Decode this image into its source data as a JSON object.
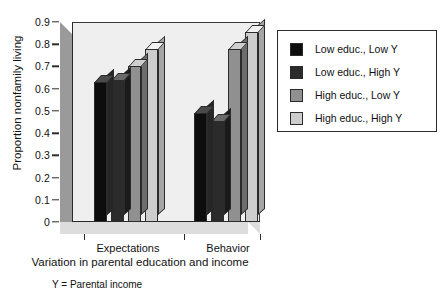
{
  "chart_data": {
    "type": "bar",
    "title": "",
    "subtitle": "",
    "xlabel": "Variation in parental education and income",
    "ylabel": "Proportion nonfamily living",
    "categories": [
      "Expectations",
      "Behavior"
    ],
    "ylim": [
      0,
      0.9
    ],
    "ytick_labels": [
      "0",
      "0.1",
      "0.2",
      "0.3",
      "0.4",
      "0.5",
      "0.6",
      "0.7",
      "0.8",
      "0.9"
    ],
    "ytick_values": [
      0,
      0.1,
      0.2,
      0.3,
      0.4,
      0.5,
      0.6,
      0.7,
      0.8,
      0.9
    ],
    "grid": false,
    "legend_position": "right",
    "footnote": "Y = Parental income",
    "series": [
      {
        "name": "Low educ., Low Y",
        "color": "#0d0d0d",
        "top_color": "#4a4a4a",
        "side_color": "#262626",
        "values": [
          0.63,
          0.49
        ]
      },
      {
        "name": "Low educ., High Y",
        "color": "#2b2b2b",
        "top_color": "#6a6a6a",
        "side_color": "#1a1a1a",
        "values": [
          0.64,
          0.455
        ]
      },
      {
        "name": "High educ., Low Y",
        "color": "#909090",
        "top_color": "#cfcfcf",
        "side_color": "#6d6d6d",
        "values": [
          0.7,
          0.78
        ]
      },
      {
        "name": "High educ., High Y",
        "color": "#cdcdcd",
        "top_color": "#f2f2f2",
        "side_color": "#a6a6a6",
        "values": [
          0.78,
          0.855
        ]
      }
    ]
  }
}
